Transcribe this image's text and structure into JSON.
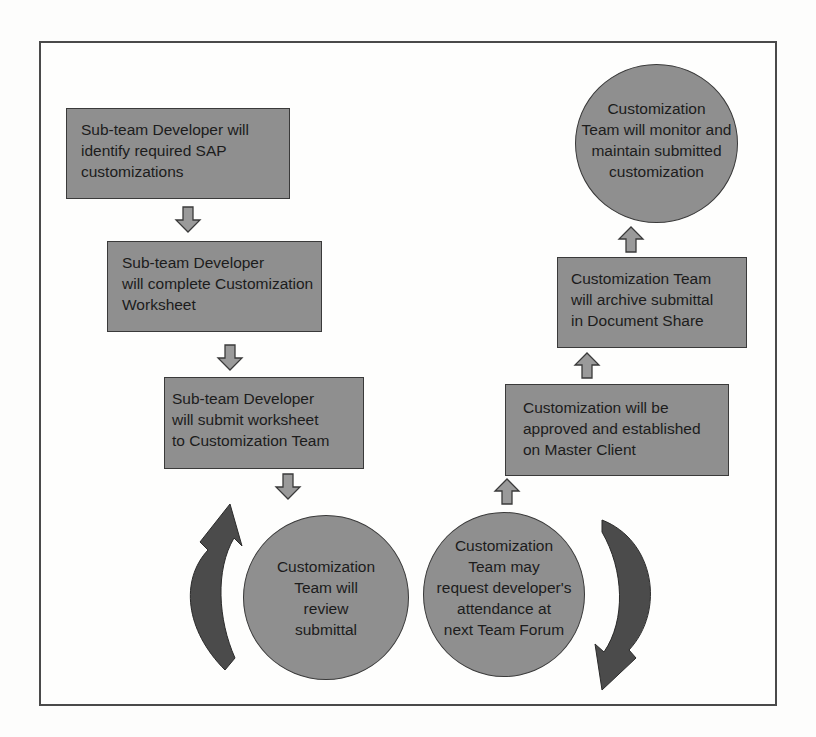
{
  "diagram": {
    "type": "process flowchart",
    "steps": [
      {
        "id": "step1",
        "shape": "rectangle",
        "lines": [
          "Sub-team Developer will",
          "identify required SAP",
          "customizations"
        ]
      },
      {
        "id": "step2",
        "shape": "rectangle",
        "lines": [
          "Sub-team Developer",
          "will complete Customization",
          "Worksheet"
        ]
      },
      {
        "id": "step3",
        "shape": "rectangle",
        "lines": [
          "Sub-team Developer",
          "will submit worksheet",
          "to Customization Team"
        ]
      },
      {
        "id": "step4",
        "shape": "circle",
        "lines": [
          "Customization",
          "Team will",
          "review",
          "submittal"
        ]
      },
      {
        "id": "step5",
        "shape": "circle",
        "lines": [
          "Customization",
          "Team may",
          "request developer's",
          "attendance at",
          "next Team Forum"
        ]
      },
      {
        "id": "step6",
        "shape": "rectangle",
        "lines": [
          "Customization will be",
          "approved and established",
          "on Master Client"
        ]
      },
      {
        "id": "step7",
        "shape": "rectangle",
        "lines": [
          "Customization Team",
          "will archive submittal",
          "in Document Share"
        ]
      },
      {
        "id": "step8",
        "shape": "circle",
        "lines": [
          "Customization",
          "Team will monitor and",
          "maintain submitted",
          "customization"
        ]
      }
    ],
    "arrows": [
      {
        "from": "step1",
        "to": "step2",
        "direction": "down"
      },
      {
        "from": "step2",
        "to": "step3",
        "direction": "down"
      },
      {
        "from": "step3",
        "to": "step4",
        "direction": "down"
      },
      {
        "from": "step5",
        "to": "step6",
        "direction": "up"
      },
      {
        "from": "step6",
        "to": "step7",
        "direction": "up"
      },
      {
        "from": "step7",
        "to": "step8",
        "direction": "up"
      },
      {
        "id": "loop-left",
        "type": "curved",
        "direction": "clockwise-up"
      },
      {
        "id": "loop-right",
        "type": "curved",
        "direction": "clockwise-down"
      }
    ],
    "colors": {
      "shape_fill": "#8f8f8f",
      "shape_border": "#3a3a3a",
      "loop_arrow": "#4b4b4b",
      "small_arrow": "#9a9a9a"
    }
  }
}
